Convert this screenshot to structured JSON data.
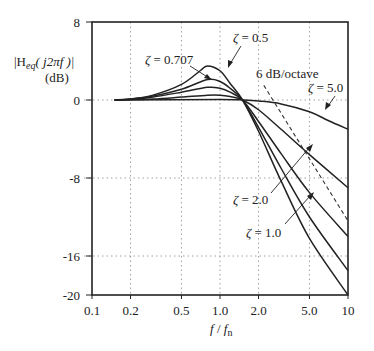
{
  "chart_data": {
    "type": "line",
    "title": "",
    "xlabel": "f / f_n",
    "ylabel": "|H_eq(j2πf)| (dB)",
    "xscale": "log",
    "xlim": [
      0.1,
      10
    ],
    "ylim": [
      -20,
      8
    ],
    "grid": true,
    "x_ticks": [
      {
        "value": 0.1,
        "label": "0.1"
      },
      {
        "value": 0.2,
        "label": "0.2"
      },
      {
        "value": 0.5,
        "label": "0.5"
      },
      {
        "value": 1.0,
        "label": "1.0"
      },
      {
        "value": 2.0,
        "label": "2.0"
      },
      {
        "value": 5.0,
        "label": "5.0"
      },
      {
        "value": 10,
        "label": "10"
      }
    ],
    "y_ticks": [
      {
        "value": 8,
        "label": "8"
      },
      {
        "value": 0,
        "label": "0"
      },
      {
        "value": -8,
        "label": "-8"
      },
      {
        "value": -16,
        "label": "-16"
      },
      {
        "value": -20,
        "label": "-20"
      }
    ],
    "series": [
      {
        "name": "ζ = 0.5",
        "style": "solid",
        "x": [
          0.15,
          0.2,
          0.3,
          0.5,
          0.7,
          0.8,
          1.0,
          1.2,
          1.5,
          2.0,
          3.0,
          5.0,
          10
        ],
        "y": [
          0,
          0.1,
          0.5,
          1.6,
          3.0,
          3.5,
          3.0,
          1.7,
          0,
          -3.2,
          -8.3,
          -14.2,
          -20
        ]
      },
      {
        "name": "ζ = 0.707",
        "style": "solid",
        "x": [
          0.15,
          0.2,
          0.3,
          0.5,
          0.8,
          1.0,
          1.2,
          1.5,
          2.0,
          3.0,
          5.0,
          10
        ],
        "y": [
          0,
          0.1,
          0.4,
          1.1,
          2.1,
          1.9,
          1.2,
          0,
          -2.8,
          -7.0,
          -12.0,
          -17.5
        ]
      },
      {
        "name": "ζ = 1.0",
        "style": "solid",
        "x": [
          0.15,
          0.2,
          0.3,
          0.5,
          0.8,
          1.0,
          1.2,
          1.5,
          2.0,
          3.0,
          5.0,
          10
        ],
        "y": [
          0,
          0.05,
          0.3,
          0.8,
          1.3,
          1.2,
          0.8,
          0,
          -2.2,
          -5.5,
          -9.5,
          -14
        ]
      },
      {
        "name": "ζ = 2.0",
        "style": "solid",
        "x": [
          0.15,
          0.3,
          0.5,
          0.8,
          1.0,
          1.2,
          1.5,
          2.0,
          3.0,
          5.0,
          10
        ],
        "y": [
          0,
          0.1,
          0.3,
          0.5,
          0.5,
          0.35,
          0,
          -1.0,
          -3.0,
          -5.6,
          -9.0
        ]
      },
      {
        "name": "ζ = 5.0",
        "style": "solid",
        "x": [
          0.15,
          1.0,
          1.5,
          2.0,
          3.0,
          5.0,
          7.0,
          10
        ],
        "y": [
          0,
          0.05,
          0,
          -0.1,
          -0.4,
          -1.2,
          -2.1,
          -3.0
        ]
      },
      {
        "name": "6 dB/octave",
        "style": "dashed",
        "x": [
          2.2,
          10
        ],
        "y": [
          1.5,
          -12.4
        ]
      }
    ],
    "annotations": [
      {
        "text": "ζ = 0.707",
        "points_to": {
          "x": 0.95,
          "y": 2.0
        }
      },
      {
        "text": "ζ = 0.5",
        "points_to": {
          "x": 1.0,
          "y": 3.0
        }
      },
      {
        "text": "6 dB/octave",
        "points_to": null
      },
      {
        "text": "ζ = 5.0",
        "points_to": {
          "x": 6.5,
          "y": -1.9
        }
      },
      {
        "text": "ζ = 2.0",
        "points_to": {
          "x": 5.0,
          "y": -5.6
        }
      },
      {
        "text": "ζ = 1.0",
        "points_to": {
          "x": 5.0,
          "y": -9.6
        }
      }
    ]
  },
  "labels": {
    "ylabel_line1": "|H",
    "ylabel_sub": "eq",
    "ylabel_rest": "( j2πf )|",
    "ylabel_line2": "(dB)",
    "xlabel_f": "f",
    "xlabel_slash": " / ",
    "xlabel_fn": "f",
    "xlabel_sub": "n",
    "zeta": "ζ",
    "ann_0707": " = 0.707",
    "ann_05": " = 0.5",
    "ann_slope": "6 dB/octave",
    "ann_5": " = 5.0",
    "ann_2": " = 2.0",
    "ann_1": " = 1.0"
  }
}
